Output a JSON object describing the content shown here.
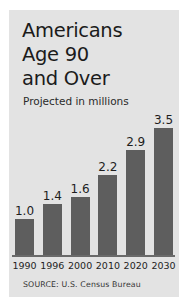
{
  "chart_data": {
    "type": "bar",
    "title": "Americans\nAge 90\nand Over",
    "subtitle": "Projected in millions",
    "source": "SOURCE: U.S. Census Bureau",
    "categories": [
      "1990",
      "1996",
      "2000",
      "2010",
      "2020",
      "2030"
    ],
    "values": [
      1.0,
      1.4,
      1.6,
      2.2,
      2.9,
      3.5
    ],
    "value_labels": [
      "1.0",
      "1.4",
      "1.6",
      "2.2",
      "2.9",
      "3.5"
    ],
    "xlabel": "",
    "ylabel": "Projected in millions",
    "ylim": [
      0,
      3.9
    ],
    "grid": false,
    "legend": false,
    "colors": {
      "bar": "#5e5e5e",
      "panel_background": "#e3e3e3",
      "page_background": "#ffffff",
      "text": "#1b1b1b",
      "axis_line": "#6a6a6a"
    }
  }
}
